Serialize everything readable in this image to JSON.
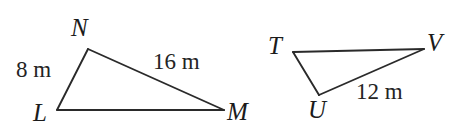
{
  "figure": {
    "background_color": "#ffffff",
    "stroke_color": "#2a2a2a",
    "text_color": "#1b1b1b",
    "triangles": [
      {
        "name": "triangle-LNM",
        "vertices": [
          {
            "label": "L",
            "x": 57,
            "y": 110
          },
          {
            "label": "N",
            "x": 88,
            "y": 49
          },
          {
            "label": "M",
            "x": 224,
            "y": 110
          }
        ],
        "measures": [
          {
            "side": "LN",
            "text": "8 m",
            "value": 8,
            "unit": "m"
          },
          {
            "side": "NM",
            "text": "16 m",
            "value": 16,
            "unit": "m"
          }
        ]
      },
      {
        "name": "triangle-TUV",
        "vertices": [
          {
            "label": "T",
            "x": 293,
            "y": 52
          },
          {
            "label": "V",
            "x": 424,
            "y": 49
          },
          {
            "label": "U",
            "x": 319,
            "y": 95
          }
        ],
        "measures": [
          {
            "side": "UV",
            "text": "12 m",
            "value": 12,
            "unit": "m"
          }
        ]
      }
    ],
    "labels": {
      "N": "N",
      "L": "L",
      "M": "M",
      "T": "T",
      "V": "V",
      "U": "U",
      "LN_measure": "8 m",
      "NM_measure": "16 m",
      "UV_measure": "12 m"
    }
  }
}
